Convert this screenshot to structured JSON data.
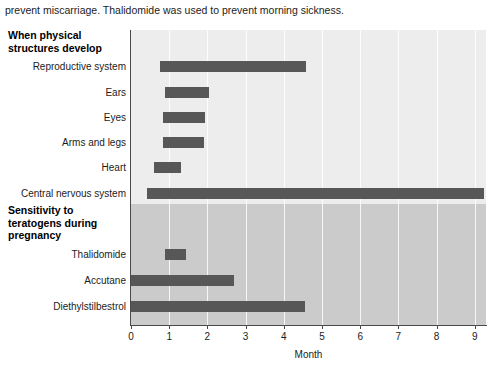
{
  "caption": "prevent miscarriage. Thalidomide was used to prevent morning sickness.",
  "figure": {
    "sections": [
      {
        "id": "development",
        "heading": "When physical structures develop",
        "band_color": "#ededed"
      },
      {
        "id": "sensitivity",
        "heading": "Sensitivity to teratogens during pregnancy",
        "band_color": "#cbcbcb"
      }
    ],
    "axis": {
      "x_title": "Month",
      "x_ticks": [
        "0",
        "1",
        "2",
        "3",
        "4",
        "5",
        "6",
        "7",
        "8",
        "9"
      ],
      "x_min": 0,
      "x_max": 9.3,
      "bar_color": "#575757"
    }
  },
  "chart_data": {
    "type": "bar",
    "orientation": "horizontal",
    "title": "",
    "xlabel": "Month",
    "ylabel": "",
    "xlim": [
      0,
      9.3
    ],
    "grid": true,
    "legend": "none",
    "note": "Floating (range) bars: each bar spans a start month to an end month.",
    "groups": [
      {
        "name": "When physical structures develop",
        "background": "#ededed",
        "categories": [
          "Reproductive system",
          "Ears",
          "Eyes",
          "Arms and legs",
          "Heart",
          "Central nervous system"
        ],
        "ranges": [
          {
            "label": "Reproductive system",
            "start": 0.76,
            "end": 4.58
          },
          {
            "label": "Ears",
            "start": 0.9,
            "end": 2.05
          },
          {
            "label": "Eyes",
            "start": 0.85,
            "end": 1.95
          },
          {
            "label": "Arms and legs",
            "start": 0.85,
            "end": 1.9
          },
          {
            "label": "Heart",
            "start": 0.6,
            "end": 1.3
          },
          {
            "label": "Central nervous system",
            "start": 0.42,
            "end": 9.25
          }
        ]
      },
      {
        "name": "Sensitivity to teratogens during pregnancy",
        "background": "#cbcbcb",
        "categories": [
          "Thalidomide",
          "Accutane",
          "Diethylstilbestrol"
        ],
        "ranges": [
          {
            "label": "Thalidomide",
            "start": 0.9,
            "end": 1.45
          },
          {
            "label": "Accutane",
            "start": 0.0,
            "end": 2.7
          },
          {
            "label": "Diethylstilbestrol",
            "start": 0.0,
            "end": 4.55
          }
        ]
      }
    ]
  }
}
